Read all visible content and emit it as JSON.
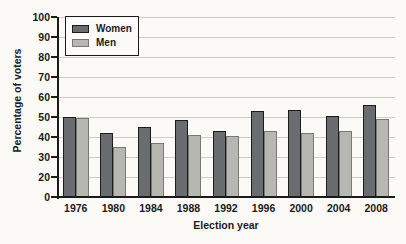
{
  "figure": {
    "background": "#fbfaf7"
  },
  "chart_data": {
    "type": "bar",
    "title": "",
    "categories": [
      "1976",
      "1980",
      "1984",
      "1988",
      "1992",
      "1996",
      "2000",
      "2004",
      "2008"
    ],
    "series": [
      {
        "name": "Women",
        "color": "#696d70",
        "border_color": "#1b1b1b",
        "values": [
          50,
          42,
          45,
          48.5,
          43,
          53,
          53.5,
          50.5,
          56
        ]
      },
      {
        "name": "Men",
        "color": "#b5b7b0",
        "border_color": "#787a72",
        "values": [
          49.5,
          35,
          37,
          41,
          40.5,
          43,
          42,
          43,
          49
        ]
      }
    ],
    "xlabel": "Election year",
    "ylabel": "Percentage of voters",
    "y_tick_labels": [
      "100",
      "90",
      "80",
      "70",
      "60",
      "50",
      "40",
      "30",
      "20",
      "0"
    ],
    "ylim": [
      0,
      100
    ],
    "grid": true,
    "gridline_color": "#d0cecb",
    "axis_color": "#1b1b1b",
    "text_color": "#1b1b1b",
    "legend_position": "top-left"
  }
}
